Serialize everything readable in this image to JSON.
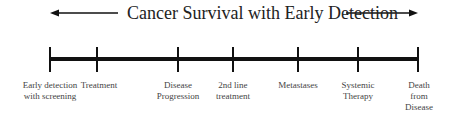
{
  "title": "Cancer Survival with Early Detection",
  "colors": {
    "line": "#111111",
    "text": "#333333",
    "background": "#ffffff"
  },
  "timeline": {
    "direction": "left-to-right",
    "events": [
      {
        "label_line1": "Early detection",
        "label_line2": "with screening",
        "label_line3": "",
        "x": 50
      },
      {
        "label_line1": "Treatment",
        "label_line2": "",
        "label_line3": "",
        "x": 97
      },
      {
        "label_line1": "Disease",
        "label_line2": "Progression",
        "label_line3": "",
        "x": 178
      },
      {
        "label_line1": "2nd line",
        "label_line2": "treatment",
        "label_line3": "",
        "x": 233
      },
      {
        "label_line1": "Metastases",
        "label_line2": "",
        "label_line3": "",
        "x": 298
      },
      {
        "label_line1": "Systemic",
        "label_line2": "Therapy",
        "label_line3": "",
        "x": 358
      },
      {
        "label_line1": "Death",
        "label_line2": "from",
        "label_line3": "Disease",
        "x": 418
      }
    ]
  },
  "icons": {
    "left_arrow": "arrow-left-icon",
    "right_arrow": "arrow-right-icon"
  }
}
